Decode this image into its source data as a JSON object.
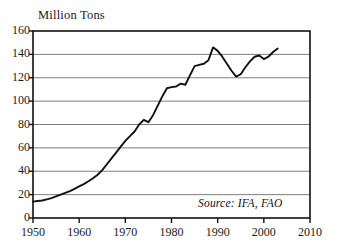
{
  "chart_data": {
    "type": "line",
    "title": "Million Tons",
    "xlabel": "",
    "ylabel": "Million Tons",
    "xlim": [
      1950,
      2010
    ],
    "ylim": [
      0,
      160
    ],
    "grid": true,
    "legend": null,
    "yticks": [
      0,
      20,
      40,
      60,
      80,
      100,
      120,
      140,
      160
    ],
    "xticks": [
      1950,
      1960,
      1970,
      1980,
      1990,
      2000,
      2010
    ],
    "annotation": "Source: IFA, FAO",
    "series": [
      {
        "name": "Fertilizer use",
        "color": "#111111",
        "x": [
          1950,
          1951,
          1952,
          1953,
          1954,
          1955,
          1956,
          1957,
          1958,
          1959,
          1960,
          1961,
          1962,
          1963,
          1964,
          1965,
          1966,
          1967,
          1968,
          1969,
          1970,
          1971,
          1972,
          1973,
          1974,
          1975,
          1976,
          1977,
          1978,
          1979,
          1980,
          1981,
          1982,
          1983,
          1984,
          1985,
          1986,
          1987,
          1988,
          1989,
          1990,
          1991,
          1992,
          1993,
          1994,
          1995,
          1996,
          1997,
          1998,
          1999,
          2000,
          2001,
          2002,
          2003
        ],
        "values": [
          14,
          14.5,
          15,
          16,
          17,
          18.5,
          20,
          21.5,
          23,
          25,
          27,
          29,
          31.5,
          34,
          37,
          41,
          46,
          51,
          56,
          61,
          66,
          70,
          74,
          80,
          84,
          82,
          88,
          96,
          104,
          111,
          112,
          112.5,
          115,
          114,
          122,
          130,
          131,
          132,
          135,
          146,
          143,
          138,
          132,
          126,
          121,
          123,
          129,
          134,
          138,
          139,
          136,
          138,
          142,
          145
        ]
      }
    ]
  }
}
